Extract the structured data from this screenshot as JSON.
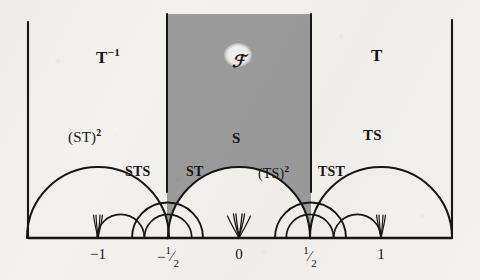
{
  "figure": {
    "name": "modular-group-fundamental-domain-tessellation",
    "background_color": "#f2f1ee",
    "ink_color": "#161616",
    "shade_color": "#9b9b9b",
    "width": 480,
    "height": 280
  },
  "axis": {
    "name": "real-axis",
    "y": 238,
    "x_start": 28,
    "x_end": 452,
    "ticks": [
      {
        "label": "-1",
        "value": -1,
        "x": 98,
        "display": "−1"
      },
      {
        "label": "-1/2",
        "value": -0.5,
        "x": 168,
        "num": "1",
        "den": "2",
        "sign": "−"
      },
      {
        "label": "0",
        "value": 0,
        "x": 239,
        "display": "0"
      },
      {
        "label": "1/2",
        "value": 0.5,
        "x": 310,
        "num": "1",
        "den": "2",
        "sign": ""
      },
      {
        "label": "1",
        "value": 1,
        "x": 381,
        "display": "1"
      }
    ],
    "unit_px": 71
  },
  "domain_labels": [
    {
      "id": "T-inverse",
      "text": "T",
      "sup": "−1",
      "x": 96,
      "y": 47,
      "size": 17,
      "paren": false
    },
    {
      "id": "F-domain",
      "text": "ℱ",
      "sup": "",
      "x": 232,
      "y": 53,
      "size": 17,
      "paren": false
    },
    {
      "id": "T",
      "text": "T",
      "sup": "",
      "x": 371,
      "y": 47,
      "size": 17,
      "paren": false
    },
    {
      "id": "ST-squared",
      "text": "(ST)",
      "sup": "2",
      "x": 68,
      "y": 128,
      "size": 15,
      "paren": true
    },
    {
      "id": "S",
      "text": "S",
      "sup": "",
      "x": 232,
      "y": 131,
      "size": 15,
      "paren": false
    },
    {
      "id": "TS",
      "text": "TS",
      "sup": "",
      "x": 363,
      "y": 128,
      "size": 15,
      "paren": false
    },
    {
      "id": "STS",
      "text": "STS",
      "sup": "",
      "x": 125,
      "y": 165,
      "size": 14,
      "paren": false
    },
    {
      "id": "ST",
      "text": "ST",
      "sup": "",
      "x": 186,
      "y": 165,
      "size": 14,
      "paren": false
    },
    {
      "id": "TS-squared",
      "text": "(TS)",
      "sup": "2",
      "x": 258,
      "y": 165,
      "size": 14,
      "paren": true
    },
    {
      "id": "TST",
      "text": "TST",
      "sup": "",
      "x": 318,
      "y": 165,
      "size": 14,
      "paren": false
    }
  ],
  "shaded_region": {
    "name": "fundamental-domain-F",
    "left_x": 167,
    "right_x": 311,
    "top_y": 14,
    "arc_bottom_y": 115,
    "fill": "#9b9b9b"
  },
  "caption_symbols": {
    "script_f": "ℱ"
  }
}
